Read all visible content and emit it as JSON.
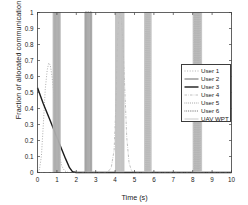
{
  "figure": {
    "background": "#ffffff",
    "axis_color": "#3c3c3c"
  },
  "chart_data": {
    "type": "line",
    "title": "",
    "xlabel": "Time (s)",
    "ylabel": "Fraction of allocated communication time",
    "xlim": [
      0,
      10
    ],
    "ylim": [
      0,
      1
    ],
    "xticks": [
      0,
      1,
      2,
      3,
      4,
      5,
      6,
      7,
      8,
      9,
      10
    ],
    "xticklabels": [
      "0",
      "1",
      "2",
      "3",
      "4",
      "5",
      "6",
      "7",
      "8",
      "9",
      "10"
    ],
    "yticks": [
      0,
      0.1,
      0.2,
      0.3,
      0.4,
      0.5,
      0.6,
      0.7,
      0.8,
      0.9,
      1
    ],
    "yticklabels": [
      "0",
      "0.1",
      "0.2",
      "0.3",
      "0.4",
      "0.5",
      "0.6",
      "0.7",
      "0.8",
      "0.9",
      "1"
    ],
    "grid": false,
    "legend_position": "center right",
    "legend_entries": [
      "User 1",
      "User 2",
      "User 3",
      "User 4",
      "User 5",
      "User 6",
      "UAV WPT"
    ],
    "series": [
      {
        "name": "User 1",
        "color": "#9a9a9a",
        "dash": "1,1.6",
        "width": 0.8,
        "points": [
          [
            0.0,
            0.0
          ],
          [
            0.1,
            0.02
          ],
          [
            0.2,
            0.1
          ],
          [
            0.3,
            0.3
          ],
          [
            0.4,
            0.52
          ],
          [
            0.5,
            0.64
          ],
          [
            0.58,
            0.685
          ],
          [
            0.66,
            0.67
          ],
          [
            0.75,
            0.6
          ],
          [
            0.85,
            0.48
          ],
          [
            0.95,
            0.33
          ],
          [
            1.05,
            0.2
          ],
          [
            1.15,
            0.1
          ],
          [
            1.25,
            0.04
          ],
          [
            1.4,
            0.01
          ],
          [
            1.6,
            0.0
          ],
          [
            4.1,
            0.0
          ],
          [
            4.18,
            0.0
          ],
          [
            10.0,
            0.0
          ]
        ]
      },
      {
        "name": "User 2",
        "color": "#5a5a5a",
        "dash": "0",
        "width": 0.9,
        "pulses": [
          {
            "x": 0.86,
            "w": 0.035
          },
          {
            "x": 0.91,
            "w": 0.035
          },
          {
            "x": 0.96,
            "w": 0.035
          },
          {
            "x": 1.01,
            "w": 0.035
          },
          {
            "x": 1.06,
            "w": 0.035
          },
          {
            "x": 1.11,
            "w": 0.035
          }
        ]
      },
      {
        "name": "User 3",
        "color": "#1a1a1a",
        "dash": "0",
        "width": 1.4,
        "points": [
          [
            0.0,
            0.53
          ],
          [
            0.3,
            0.43
          ],
          [
            0.6,
            0.34
          ],
          [
            0.9,
            0.25
          ],
          [
            1.2,
            0.16
          ],
          [
            1.45,
            0.085
          ],
          [
            1.65,
            0.03
          ],
          [
            1.8,
            0.005
          ],
          [
            2.0,
            0.0
          ],
          [
            10.0,
            0.0
          ]
        ],
        "pulses": [
          {
            "x": 2.5,
            "w": 0.05
          },
          {
            "x": 2.62,
            "w": 0.05
          },
          {
            "x": 2.74,
            "w": 0.05
          }
        ]
      },
      {
        "name": "User 4",
        "color": "#b0b0b0",
        "dash": "2.5,1.2,0.6,1.2",
        "width": 0.8,
        "points": [
          [
            0.0,
            0.0
          ],
          [
            3.6,
            0.0
          ],
          [
            3.8,
            0.03
          ],
          [
            3.95,
            0.14
          ],
          [
            4.05,
            0.45
          ],
          [
            4.12,
            0.8
          ],
          [
            4.18,
            0.95
          ],
          [
            4.24,
            1.0
          ],
          [
            4.32,
            0.96
          ],
          [
            4.4,
            0.82
          ],
          [
            4.5,
            0.52
          ],
          [
            4.6,
            0.22
          ],
          [
            4.72,
            0.06
          ],
          [
            4.85,
            0.01
          ],
          [
            5.0,
            0.0
          ],
          [
            10.0,
            0.0
          ]
        ]
      },
      {
        "name": "User 5",
        "color": "#8a8a8a",
        "dash": "0.8,1.1",
        "width": 0.9,
        "pulses": [
          {
            "x": 5.58,
            "w": 0.03
          },
          {
            "x": 5.63,
            "w": 0.03
          },
          {
            "x": 5.68,
            "w": 0.03
          },
          {
            "x": 5.73,
            "w": 0.03
          },
          {
            "x": 5.78,
            "w": 0.03
          }
        ]
      },
      {
        "name": "User 6",
        "color": "#4a4a4a",
        "dash": "0.8,1.0",
        "width": 0.9,
        "pulses": [
          {
            "x": 8.08,
            "w": 0.03
          },
          {
            "x": 8.14,
            "w": 0.03
          },
          {
            "x": 8.2,
            "w": 0.03
          },
          {
            "x": 8.26,
            "w": 0.03
          },
          {
            "x": 8.32,
            "w": 0.03
          },
          {
            "x": 8.38,
            "w": 0.03
          }
        ]
      },
      {
        "name": "UAV WPT",
        "color": "#bdbdbd",
        "dash": "0",
        "width": 0.8,
        "bands": [
          {
            "x0": 0.8,
            "x1": 1.18
          },
          {
            "x0": 2.46,
            "x1": 2.8
          },
          {
            "x0": 4.02,
            "x1": 4.46
          },
          {
            "x0": 5.52,
            "x1": 5.86
          },
          {
            "x0": 8.02,
            "x1": 8.46
          }
        ]
      }
    ]
  }
}
